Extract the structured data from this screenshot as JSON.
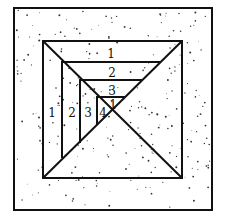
{
  "figure": {
    "outer_square": {
      "x": 14,
      "y": 8,
      "w": 198,
      "h": 202
    },
    "inner_square": {
      "x": 43,
      "y": 41,
      "w": 139,
      "h": 137
    },
    "center": {
      "x": 113,
      "y": 112
    },
    "colors": {
      "line": "#111111",
      "speckle": "#333333",
      "background": "#ffffff"
    },
    "top_labels": [
      {
        "text": "1",
        "x": 111,
        "y": 56
      },
      {
        "text": "2",
        "x": 112,
        "y": 77
      },
      {
        "text": "3",
        "x": 112,
        "y": 95
      },
      {
        "text": "1",
        "x": 112,
        "y": 109
      }
    ],
    "left_labels": [
      {
        "text": "1",
        "x": 52,
        "y": 116
      },
      {
        "text": "2",
        "x": 72,
        "y": 116
      },
      {
        "text": "3",
        "x": 88,
        "y": 116
      },
      {
        "text": "4",
        "x": 102,
        "y": 116
      }
    ],
    "nested_levels": [
      {
        "level": 1,
        "left_x": 62,
        "top_y": 62
      },
      {
        "level": 2,
        "left_x": 80,
        "top_y": 80
      },
      {
        "level": 3,
        "left_x": 97,
        "top_y": 97
      }
    ]
  }
}
